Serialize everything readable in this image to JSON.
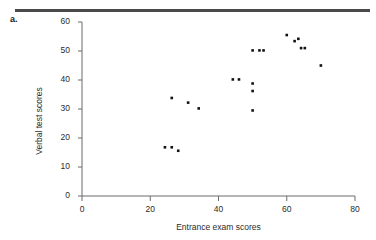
{
  "figure": {
    "panel_label": "a.",
    "top_rule_color": "#4a4a4a"
  },
  "chart_data": {
    "type": "scatter",
    "title": "",
    "xlabel": "Entrance exam scores",
    "ylabel": "Verbal test scores",
    "xlim": [
      0,
      80
    ],
    "ylim": [
      0,
      60
    ],
    "xticks": [
      0,
      20,
      40,
      60,
      80
    ],
    "yticks": [
      0,
      10,
      20,
      30,
      40,
      50,
      60
    ],
    "xtick_labels": [
      "0",
      "20",
      "40",
      "60",
      "80"
    ],
    "ytick_labels": [
      "0",
      "10",
      "20",
      "30",
      "40",
      "50",
      "60"
    ],
    "grid": false,
    "legend": false,
    "marker_color": "#111111",
    "marker_size": 2.6,
    "point_count": 17,
    "points": [
      {
        "x": 24.3,
        "y": 16.8
      },
      {
        "x": 26.3,
        "y": 16.8
      },
      {
        "x": 28.2,
        "y": 15.6
      },
      {
        "x": 26.3,
        "y": 33.8
      },
      {
        "x": 31.1,
        "y": 32.2
      },
      {
        "x": 34.2,
        "y": 30.2
      },
      {
        "x": 44.2,
        "y": 40.2
      },
      {
        "x": 46.0,
        "y": 40.2
      },
      {
        "x": 50.0,
        "y": 38.8
      },
      {
        "x": 50.0,
        "y": 36.2
      },
      {
        "x": 50.0,
        "y": 29.5
      },
      {
        "x": 50.0,
        "y": 50.2
      },
      {
        "x": 52.0,
        "y": 50.2
      },
      {
        "x": 53.2,
        "y": 50.2
      },
      {
        "x": 60.0,
        "y": 55.5
      },
      {
        "x": 62.3,
        "y": 53.4
      },
      {
        "x": 63.4,
        "y": 54.2
      },
      {
        "x": 64.2,
        "y": 51.0
      },
      {
        "x": 65.3,
        "y": 51.0
      },
      {
        "x": 70.0,
        "y": 45.0
      }
    ]
  }
}
